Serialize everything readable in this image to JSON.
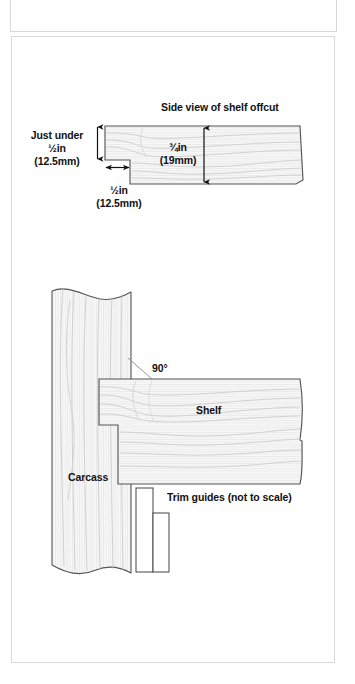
{
  "figure": {
    "type": "woodworking-technical-diagram",
    "panels": [
      {
        "id": "offcut-panel",
        "title": "Side view of shelf offcut",
        "labels": {
          "left_dim": "Just under",
          "left_dim_value": "½in",
          "left_dim_metric": "(12.5mm)",
          "bottom_dim_value": "½in",
          "bottom_dim_metric": "(12.5mm)",
          "thickness_value": "¾in",
          "thickness_metric": "(19mm)"
        }
      },
      {
        "id": "joint-panel",
        "labels": {
          "angle": "90°",
          "shelf": "Shelf",
          "carcass": "Carcass",
          "trim_guides": "Trim guides (not to scale)"
        }
      }
    ]
  },
  "colors": {
    "ink": "#1a1a1a",
    "outline": "#4a4a4a",
    "wood_fill": "#f7f7f7",
    "grain": "#c9c9c9",
    "frame": "#d9d9d9",
    "white": "#ffffff"
  },
  "icons": {
    "arrow_up": "arrow-up-icon",
    "arrow_down": "arrow-down-icon",
    "arrow_left": "arrow-left-icon",
    "arrow_right": "arrow-right-icon"
  }
}
